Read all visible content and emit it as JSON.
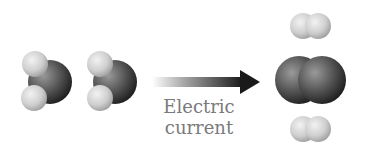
{
  "diagram": {
    "reactants": [
      {
        "molecule": "water",
        "atoms": [
          "O",
          "H",
          "H"
        ]
      },
      {
        "molecule": "water",
        "atoms": [
          "O",
          "H",
          "H"
        ]
      }
    ],
    "arrow": {
      "label_line1": "Electric",
      "label_line2": "current"
    },
    "products": [
      {
        "molecule": "hydrogen",
        "atoms": [
          "H",
          "H"
        ]
      },
      {
        "molecule": "oxygen",
        "atoms": [
          "O",
          "O"
        ]
      },
      {
        "molecule": "hydrogen",
        "atoms": [
          "H",
          "H"
        ]
      }
    ],
    "colors": {
      "oxygen": "#3a3a3a",
      "hydrogen": "#cfcfcf",
      "arrow": "#222222",
      "text": "#7a7a7a"
    }
  }
}
